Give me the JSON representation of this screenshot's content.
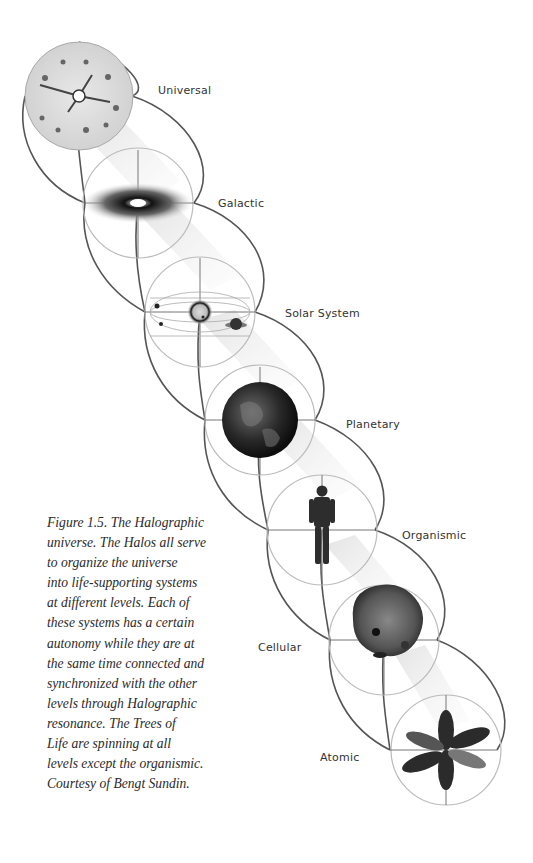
{
  "levels": [
    {
      "label": "Universal",
      "label_x": 158,
      "label_y": 90
    },
    {
      "label": "Galactic",
      "label_x": 218,
      "label_y": 197
    },
    {
      "label": "Solar System",
      "label_x": 285,
      "label_y": 307
    },
    {
      "label": "Planetary",
      "label_x": 346,
      "label_y": 418
    },
    {
      "label": "Organismic",
      "label_x": 402,
      "label_y": 529
    },
    {
      "label": "Cellular",
      "label_x": 258,
      "label_y": 641
    },
    {
      "label": "Atomic",
      "label_x": 320,
      "label_y": 751
    }
  ],
  "caption": {
    "lines": [
      "Figure 1.5. The Halographic",
      "universe. The Halos all serve",
      "to organize the universe",
      "into life-supporting systems",
      "at different levels. Each of",
      "these systems has a certain",
      "autonomy while they are at",
      "the same time connected and",
      "synchronized with the other",
      "levels through Halographic",
      "resonance. The Trees of",
      "Life are spinning at all",
      "levels except the organismic.",
      "Courtesy of Bengt Sundin."
    ]
  },
  "colors": {
    "background": "#ffffff",
    "line": "#555555",
    "circle": "#bbbbbb",
    "text": "#333333"
  }
}
